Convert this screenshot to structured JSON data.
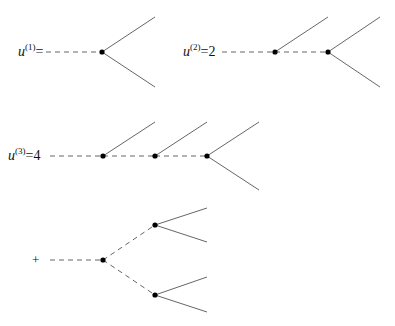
{
  "diagrams": [
    {
      "id": "u1",
      "label": {
        "base": "u",
        "sup": "(1)",
        "rhs": "="
      },
      "vertices": [
        [
          102,
          52
        ]
      ],
      "dashed": [
        [
          46,
          52,
          102,
          52
        ]
      ],
      "solid": [
        [
          102,
          52,
          155,
          17
        ],
        [
          102,
          52,
          155,
          87
        ]
      ]
    },
    {
      "id": "u2",
      "label": {
        "base": "u",
        "sup": "(2)",
        "rhs": "=2"
      },
      "vertices": [
        [
          275,
          52
        ],
        [
          328,
          52
        ]
      ],
      "dashed": [
        [
          222,
          52,
          275,
          52
        ],
        [
          275,
          52,
          328,
          52
        ]
      ],
      "solid": [
        [
          275,
          52,
          328,
          17
        ],
        [
          328,
          52,
          380,
          17
        ],
        [
          328,
          52,
          380,
          87
        ]
      ]
    },
    {
      "id": "u3",
      "label": {
        "base": "u",
        "sup": "(3)",
        "rhs": "=4"
      },
      "vertices": [
        [
          103,
          156
        ],
        [
          155,
          156
        ],
        [
          207,
          156
        ]
      ],
      "dashed": [
        [
          50,
          156,
          103,
          156
        ],
        [
          103,
          156,
          155,
          156
        ],
        [
          155,
          156,
          207,
          156
        ]
      ],
      "solid": [
        [
          103,
          156,
          155,
          122
        ],
        [
          155,
          156,
          207,
          122
        ],
        [
          207,
          156,
          259,
          122
        ],
        [
          207,
          156,
          259,
          190
        ]
      ]
    },
    {
      "id": "plus-term",
      "label": {
        "base": "",
        "sup": "",
        "rhs": "+"
      },
      "vertices": [
        [
          103,
          260
        ],
        [
          155,
          225
        ],
        [
          155,
          295
        ]
      ],
      "dashed": [
        [
          50,
          260,
          103,
          260
        ],
        [
          103,
          260,
          155,
          225
        ],
        [
          103,
          260,
          155,
          295
        ]
      ],
      "solid": [
        [
          155,
          225,
          207,
          208
        ],
        [
          155,
          225,
          207,
          242
        ],
        [
          155,
          295,
          207,
          277
        ],
        [
          155,
          295,
          207,
          312
        ]
      ]
    }
  ],
  "labels": {
    "u1_base": "u",
    "u1_sup": "(1)",
    "u1_rhs": "=",
    "u2_base": "u",
    "u2_sup": "(2)",
    "u2_rhs": "=2",
    "u3_base": "u",
    "u3_sup": "(3)",
    "u3_rhs": "=4",
    "plus": "+"
  },
  "colors": {
    "line": "#555555",
    "vertex": "#000000",
    "text": "#111111"
  }
}
